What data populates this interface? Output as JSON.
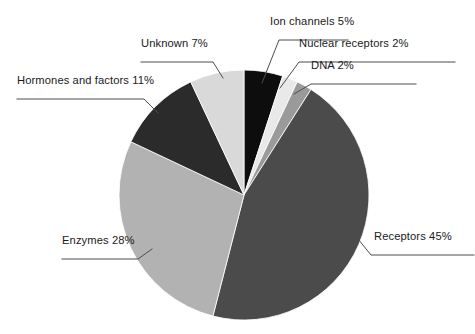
{
  "chart_data": {
    "type": "pie",
    "title": "",
    "subtitle": "",
    "xlabel": "",
    "ylabel": "",
    "legend_position": "none",
    "grid": false,
    "labels_show_percent": true,
    "start_angle_deg": 0,
    "direction": "clockwise",
    "total_percent": 100,
    "categories": [
      "Ion channels",
      "Nuclear receptors",
      "DNA",
      "Receptors",
      "Enzymes",
      "Hormones and factors",
      "Unknown"
    ],
    "values": [
      5,
      2,
      2,
      45,
      28,
      11,
      7
    ],
    "slices": [
      {
        "name": "Ion channels",
        "value": 5,
        "percent_text": "5%",
        "label": "Ion channels 5%",
        "color": "#0d0d0d"
      },
      {
        "name": "Nuclear receptors",
        "value": 2,
        "percent_text": "2%",
        "label": "Nuclear receptors 2%",
        "color": "#e9e9e9"
      },
      {
        "name": "DNA",
        "value": 2,
        "percent_text": "2%",
        "label": "DNA 2%",
        "color": "#9a9a9a"
      },
      {
        "name": "Receptors",
        "value": 45,
        "percent_text": "45%",
        "label": "Receptors 45%",
        "color": "#4b4b4b"
      },
      {
        "name": "Enzymes",
        "value": 28,
        "percent_text": "28%",
        "label": "Enzymes 28%",
        "color": "#b2b2b2"
      },
      {
        "name": "Hormones and factors",
        "value": 11,
        "percent_text": "11%",
        "label": "Hormones and factors 11%",
        "color": "#2b2b2b"
      },
      {
        "name": "Unknown",
        "value": 7,
        "percent_text": "7%",
        "label": "Unknown 7%",
        "color": "#d9d9d9"
      }
    ]
  },
  "callouts": {
    "ion_channels": "Ion channels 5%",
    "nuclear_receptors": "Nuclear receptors 2%",
    "dna": "DNA 2%",
    "receptors": "Receptors 45%",
    "enzymes": "Enzymes 28%",
    "hormones_and_factors": "Hormones and factors 11%",
    "unknown": "Unknown 7%"
  },
  "colors": {
    "background": "#ffffff",
    "text": "#1a1a1a",
    "leader_line": "#4d4d4d",
    "slice_border": "#ffffff"
  },
  "geometry": {
    "center_x": 244,
    "center_y": 195,
    "radius": 125
  }
}
